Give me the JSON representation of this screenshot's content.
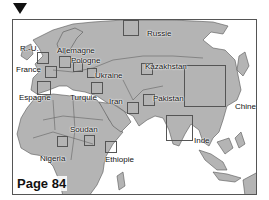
{
  "marker": {
    "icon": "triangle-down-icon"
  },
  "map": {
    "colors": {
      "land": "#b4b4b4",
      "border": "#555555",
      "sea": "#ffffff"
    },
    "page_label": "Page 84",
    "regions": [
      {
        "id": "ru",
        "label": "R.-U.",
        "label_pos": [
          7,
          24
        ],
        "box": [
          24,
          32,
          12,
          12
        ]
      },
      {
        "id": "allemagne",
        "label": "Allemagne",
        "label_pos": [
          44,
          26
        ],
        "box": [
          46,
          36,
          12,
          12
        ]
      },
      {
        "id": "pologne",
        "label": "Pologne",
        "label_pos": [
          58,
          36
        ],
        "box": [
          60,
          42,
          10,
          10
        ]
      },
      {
        "id": "france",
        "label": "France",
        "label_pos": [
          3,
          45
        ],
        "box": [
          32,
          46,
          12,
          12
        ]
      },
      {
        "id": "ukraine",
        "label": "Ukraine",
        "label_pos": [
          82,
          51
        ],
        "box": [
          74,
          48,
          10,
          10
        ]
      },
      {
        "id": "espagne",
        "label": "Espagne",
        "label_pos": [
          6,
          73
        ],
        "box": [
          24,
          61,
          14,
          14
        ]
      },
      {
        "id": "turquie",
        "label": "Turquie",
        "label_pos": [
          57,
          73
        ],
        "box": [
          78,
          62,
          12,
          12
        ]
      },
      {
        "id": "russie",
        "label": "Russie",
        "label_pos": [
          134,
          9
        ],
        "box": [
          110,
          0,
          16,
          16
        ]
      },
      {
        "id": "kazakhstan",
        "label": "Kazakhstan",
        "label_pos": [
          132,
          42
        ],
        "box": [
          128,
          43,
          12,
          12
        ]
      },
      {
        "id": "iran",
        "label": "Iran",
        "label_pos": [
          96,
          77
        ],
        "box": [
          114,
          82,
          12,
          12
        ]
      },
      {
        "id": "pakistan",
        "label": "Pakistan",
        "label_pos": [
          140,
          74
        ],
        "box": [
          130,
          74,
          12,
          12
        ]
      },
      {
        "id": "chine",
        "label": "Chine",
        "label_pos": [
          222,
          82
        ],
        "box": [
          171,
          45,
          42,
          42
        ]
      },
      {
        "id": "inde",
        "label": "Inde",
        "label_pos": [
          181,
          116
        ],
        "box": [
          153,
          95,
          27,
          26
        ]
      },
      {
        "id": "soudan",
        "label": "Soudan",
        "label_pos": [
          57,
          105
        ],
        "box": [
          71,
          115,
          11,
          11
        ]
      },
      {
        "id": "nigeria",
        "label": "Nigeria",
        "label_pos": [
          27,
          134
        ],
        "box": [
          44,
          116,
          11,
          11
        ]
      },
      {
        "id": "ethiopie",
        "label": "Ethiopie",
        "label_pos": [
          92,
          135
        ],
        "box": [
          92,
          121,
          12,
          12
        ]
      }
    ]
  }
}
